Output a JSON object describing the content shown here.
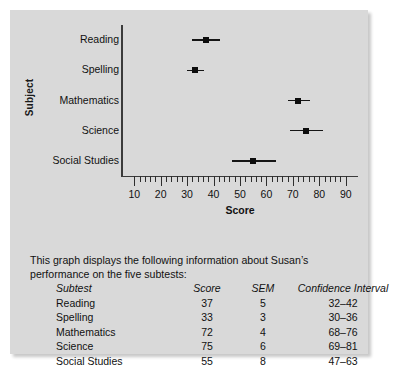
{
  "chart_data": {
    "type": "scatter",
    "title": "",
    "xlabel": "Score",
    "ylabel": "Subject",
    "xlim": [
      5,
      95
    ],
    "xticks": [
      10,
      20,
      30,
      40,
      50,
      60,
      70,
      80,
      90
    ],
    "xtick_labels": [
      "10",
      "20",
      "30",
      "40",
      "50",
      "60",
      "70",
      "80",
      "90"
    ],
    "minor_tick_step": 2,
    "grid": false,
    "legend": null,
    "categories": [
      "Reading",
      "Spelling",
      "Mathematics",
      "Science",
      "Social Studies"
    ],
    "values": [
      37,
      33,
      72,
      75,
      55
    ],
    "error_low": [
      32,
      30,
      68,
      69,
      47
    ],
    "error_high": [
      42,
      36,
      76,
      81,
      63
    ],
    "marker": "filled-square",
    "points": [
      {
        "subject": "Reading",
        "score": 37,
        "sem": 5,
        "ci_low": 32,
        "ci_high": 42
      },
      {
        "subject": "Spelling",
        "score": 33,
        "sem": 3,
        "ci_low": 30,
        "ci_high": 36
      },
      {
        "subject": "Mathematics",
        "score": 72,
        "sem": 4,
        "ci_low": 68,
        "ci_high": 76
      },
      {
        "subject": "Science",
        "score": 75,
        "sem": 6,
        "ci_low": 69,
        "ci_high": 81
      },
      {
        "subject": "Social Studies",
        "score": 55,
        "sem": 8,
        "ci_low": 47,
        "ci_high": 63
      }
    ]
  },
  "caption": {
    "text": "This graph displays the following information about Susan’s performance on the five subtests:"
  },
  "table": {
    "headers": [
      "Subtest",
      "Score",
      "SEM",
      "Confidence Interval"
    ],
    "rows": [
      {
        "subtest": "Reading",
        "score": "37",
        "sem": "5",
        "ci": "32–42"
      },
      {
        "subtest": "Spelling",
        "score": "33",
        "sem": "3",
        "ci": "30–36"
      },
      {
        "subtest": "Mathematics",
        "score": "72",
        "sem": "4",
        "ci": "68–76"
      },
      {
        "subtest": "Science",
        "score": "75",
        "sem": "6",
        "ci": "69–81"
      },
      {
        "subtest": "Social Studies",
        "score": "55",
        "sem": "8",
        "ci": "47–63"
      }
    ]
  },
  "colors": {
    "panel": "#d9d9d9",
    "axis": "#3b3b3b",
    "marker": "#0d0d0d",
    "text": "#111111"
  }
}
